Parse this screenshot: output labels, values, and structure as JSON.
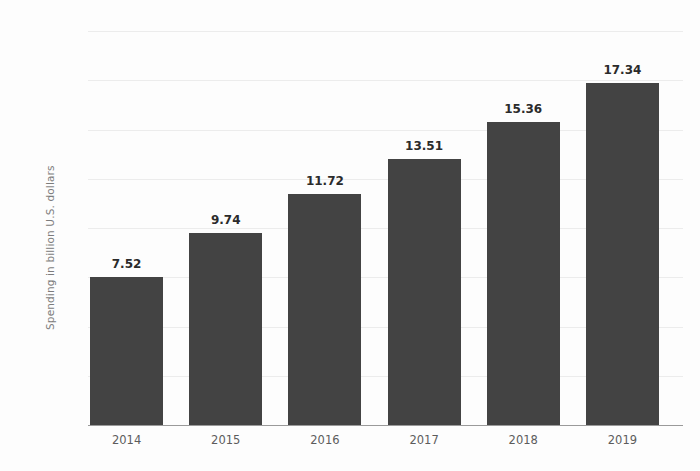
{
  "chart_data": {
    "type": "bar",
    "title": "",
    "xlabel": "",
    "ylabel": "Spending in billion U.S. dollars",
    "categories": [
      "2014",
      "2015",
      "2016",
      "2017",
      "2018",
      "2019"
    ],
    "values": [
      7.52,
      9.74,
      11.72,
      13.51,
      15.36,
      17.34
    ],
    "value_labels": [
      "7.52",
      "9.74",
      "11.72",
      "13.51",
      "15.36",
      "17.34"
    ],
    "ylim": [
      0,
      20
    ],
    "ytick_values": [
      0,
      2.5,
      5,
      7.5,
      10,
      12.5,
      15,
      17.5,
      20
    ],
    "ytick_labels": [
      "0",
      "2.5",
      "5",
      "7.5",
      "10",
      "12.5",
      "15",
      "17.5",
      "20"
    ],
    "grid": true,
    "legend": null,
    "legend_position": "none",
    "series": [
      {
        "name": "Spending",
        "values": [
          7.52,
          9.74,
          11.72,
          13.51,
          15.36,
          17.34
        ]
      }
    ]
  },
  "colors": {
    "bar": "#434343",
    "gridline": "#ececec",
    "baseline": "#9a9a9a",
    "tick_text": "#5c5c5c",
    "axis_title": "#7c7c7c",
    "value_label": "#2b2b2b",
    "background": "#fdfdfd"
  }
}
